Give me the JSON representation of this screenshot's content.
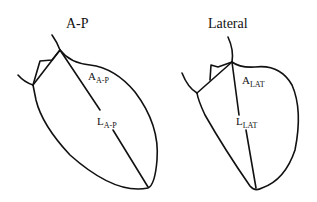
{
  "figures": [
    {
      "title": "A-P",
      "area_label": {
        "main": "A",
        "sub": "A-P"
      },
      "length_label": {
        "main": "L",
        "sub": "A-P"
      }
    },
    {
      "title": "Lateral",
      "area_label": {
        "main": "A",
        "sub": "LAT"
      },
      "length_label": {
        "main": "L",
        "sub": "LAT"
      }
    }
  ]
}
